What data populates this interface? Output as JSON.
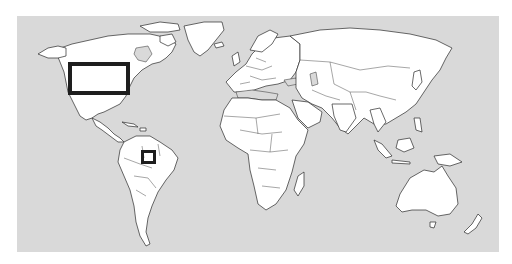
{
  "map": {
    "type": "world political outline map",
    "projection": "equirectangular-like",
    "colors": {
      "ocean": "#d9d9d9",
      "land": "#ffffff",
      "borders": "#2a2a2a",
      "highlight": "#1e1e1e",
      "page_background": "#ffffff"
    },
    "frame": {
      "x": 17,
      "y": 16,
      "width": 482,
      "height": 236
    },
    "highlights": [
      {
        "id": "north-america-box",
        "region": "Northeastern United States / Great Lakes",
        "x": 68,
        "y": 62,
        "width": 62,
        "height": 33,
        "stroke_width": 4
      },
      {
        "id": "amazon-box",
        "region": "Central Amazon, Brazil",
        "x": 141,
        "y": 150,
        "width": 15,
        "height": 14,
        "stroke_width": 3
      }
    ]
  }
}
